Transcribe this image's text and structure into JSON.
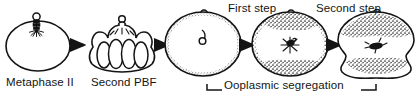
{
  "figure": {
    "background_color": "#ffffff",
    "ink_color": "#141414",
    "stipple_color": "#3a3a3a",
    "labels": {
      "metaphase_ii": "Metaphase II",
      "second_pbf": "Second PBF",
      "first_step": "First step",
      "second_step": "Second step",
      "ooplasmic_segregation": "Ooplasmic segregation"
    },
    "stages": [
      {
        "index": 1,
        "name": "metaphase-ii-oocyte",
        "caption": "Metaphase II",
        "shape": "smooth-oval",
        "has_polar_body": true,
        "interior_feature": "metaphase-spindle-with-aster",
        "membrane": "plain-outline",
        "stipple_zones": []
      },
      {
        "index": 2,
        "name": "second-polar-body-formation-oocyte",
        "caption": "Second PBF",
        "shape": "lobed-scalloped",
        "has_polar_body": true,
        "interior_feature": "radiating-lines-from-polar-body",
        "membrane": "plain-outline",
        "stipple_zones": []
      },
      {
        "index": 3,
        "name": "fertilized-egg-pronucleus",
        "caption": "",
        "shape": "round",
        "has_polar_body": true,
        "interior_feature": "small-pronucleus",
        "membrane": "fine-stippled-cortex",
        "stipple_zones": [
          "cortex-ring"
        ]
      },
      {
        "index": 4,
        "name": "ooplasmic-segregation-first-step",
        "caption": "First step",
        "shape": "round",
        "has_polar_body": true,
        "interior_feature": "central-aster",
        "membrane": "coarse-stippled-cortex",
        "stipple_zones": [
          "animal-pole-cap",
          "vegetal-pole-cap",
          "cortex-ring"
        ]
      },
      {
        "index": 5,
        "name": "ooplasmic-segregation-second-step",
        "caption": "Second step",
        "shape": "constricted-round",
        "has_polar_body": true,
        "interior_feature": "elongated-nucleus-mass",
        "membrane": "plain-outline",
        "stipple_zones": [
          "animal-pole-cap",
          "vegetal-pole-cap"
        ]
      }
    ],
    "arrows": [
      {
        "name": "arrow-1-to-2",
        "from": "metaphase-ii-oocyte",
        "to": "second-polar-body-formation-oocyte"
      },
      {
        "name": "arrow-2-to-3",
        "from": "second-polar-body-formation-oocyte",
        "to": "fertilized-egg-pronucleus"
      },
      {
        "name": "arrow-3-to-4",
        "from": "fertilized-egg-pronucleus",
        "to": "ooplasmic-segregation-first-step"
      },
      {
        "name": "arrow-4-to-5",
        "from": "ooplasmic-segregation-first-step",
        "to": "ooplasmic-segregation-second-step"
      }
    ],
    "bracket": {
      "name": "ooplasmic-segregation-bracket",
      "label": "Ooplasmic segregation",
      "spans_stages": [
        3,
        4,
        5
      ]
    }
  }
}
